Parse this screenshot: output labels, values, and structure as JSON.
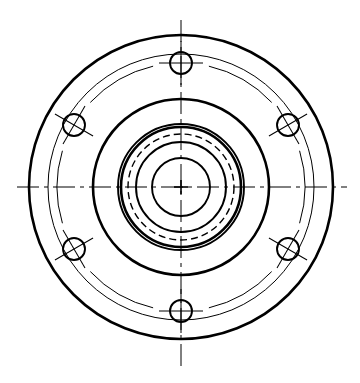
{
  "document": {
    "title": "Flange / Hub Front View",
    "drawing_type": "engineering-orthographic-front-view",
    "background_color": "#ffffff",
    "line_color": "#000000",
    "canvas": {
      "width": 360,
      "height": 383
    }
  },
  "geometry": {
    "center": {
      "x": 181,
      "y": 187
    },
    "units": "px"
  },
  "line_weights": {
    "thick": 2.6,
    "medium": 1.9,
    "thin": 1.0,
    "centerline": 1.0,
    "hidden": 1.4
  },
  "circles": [
    {
      "name": "outer-flange-edge",
      "radius": 152,
      "weight": "thick",
      "style": "solid",
      "label": "Outer flange diameter"
    },
    {
      "name": "flange-face-relief",
      "radius": 133,
      "weight": "thin",
      "style": "solid",
      "label": "Flange face relief diameter"
    },
    {
      "name": "bolt-circle",
      "radius": 124,
      "weight": "thin",
      "style": "solid",
      "label": "Bolt circle diameter (arc segments)"
    },
    {
      "name": "hub-outer",
      "radius": 88,
      "weight": "thick",
      "style": "solid",
      "label": "Hub outer diameter"
    },
    {
      "name": "boss-outer",
      "radius": 63,
      "weight": "medium",
      "style": "solid",
      "label": "Boss outer diameter"
    },
    {
      "name": "boss-shoulder",
      "radius": 60,
      "weight": "thick",
      "style": "solid",
      "label": "Boss shoulder diameter"
    },
    {
      "name": "hidden-internal-bore",
      "radius": 53,
      "weight": "hidden",
      "style": "dashed",
      "label": "Hidden internal feature diameter"
    },
    {
      "name": "counterbore",
      "radius": 45,
      "weight": "medium",
      "style": "solid",
      "label": "Counterbore diameter"
    },
    {
      "name": "center-bore",
      "radius": 29,
      "weight": "medium",
      "style": "solid",
      "label": "Center bore diameter"
    }
  ],
  "bolt_holes": {
    "count": 6,
    "hole_radius": 11,
    "bolt_circle_radius": 124,
    "crosshair_length": 22,
    "angles_deg": [
      270,
      330,
      30,
      90,
      150,
      210
    ],
    "items": [
      {
        "name": "bolt-hole-top",
        "angle_deg": 270,
        "cx": 181,
        "cy": 63,
        "crosshair_rotation_deg": 0
      },
      {
        "name": "bolt-hole-upper-right",
        "angle_deg": 330,
        "cx": 288,
        "cy": 125,
        "crosshair_rotation_deg": 330
      },
      {
        "name": "bolt-hole-lower-right",
        "angle_deg": 30,
        "cx": 288,
        "cy": 249,
        "crosshair_rotation_deg": 30
      },
      {
        "name": "bolt-hole-bottom",
        "angle_deg": 90,
        "cx": 181,
        "cy": 311,
        "crosshair_rotation_deg": 0
      },
      {
        "name": "bolt-hole-lower-left",
        "angle_deg": 150,
        "cx": 74,
        "cy": 249,
        "crosshair_rotation_deg": 150
      },
      {
        "name": "bolt-hole-upper-left",
        "angle_deg": 210,
        "cx": 74,
        "cy": 125,
        "crosshair_rotation_deg": 210
      }
    ]
  },
  "centerlines": [
    {
      "name": "horizontal-centerline",
      "orientation": "horizontal",
      "from": {
        "x": 17,
        "y": 187
      },
      "to": {
        "x": 347,
        "y": 187
      },
      "style": "dash-dot"
    },
    {
      "name": "vertical-centerline",
      "orientation": "vertical",
      "from": {
        "x": 181,
        "y": 20
      },
      "to": {
        "x": 181,
        "y": 366
      },
      "style": "dash-dot"
    }
  ],
  "center_mark": {
    "name": "center-cross",
    "x": 181,
    "y": 187,
    "arm_length": 7
  },
  "bolt_circle_arcs": [
    {
      "name": "bolt-circle-arc-top-right",
      "start_deg": 283,
      "end_deg": 317
    },
    {
      "name": "bolt-circle-arc-right",
      "start_deg": 343,
      "end_deg": 17
    },
    {
      "name": "bolt-circle-arc-bottom-right",
      "start_deg": 43,
      "end_deg": 77
    },
    {
      "name": "bolt-circle-arc-bottom-left",
      "start_deg": 103,
      "end_deg": 137
    },
    {
      "name": "bolt-circle-arc-left",
      "start_deg": 163,
      "end_deg": 197
    },
    {
      "name": "bolt-circle-arc-top-left",
      "start_deg": 223,
      "end_deg": 257
    }
  ]
}
